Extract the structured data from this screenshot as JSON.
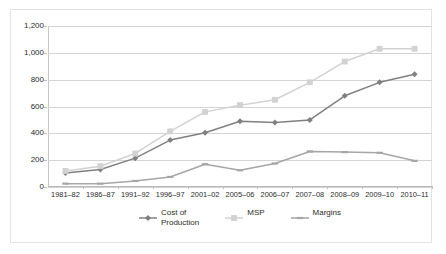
{
  "chart_data": {
    "type": "line",
    "title": "",
    "subtitle": "",
    "xlabel": "",
    "ylabel": "",
    "ylim": [
      0,
      1200
    ],
    "ytick_step": 200,
    "ytick_labels": [
      "0",
      "200",
      "400",
      "600",
      "800",
      "1,000",
      "1,200"
    ],
    "ytick_values": [
      0,
      200,
      400,
      600,
      800,
      1000,
      1200
    ],
    "grid": true,
    "legend_position": "bottom",
    "categories": [
      "1981–82",
      "1986–87",
      "1991–92",
      "1996–97",
      "2001–02",
      "2005–06",
      "2006–07",
      "2007–08",
      "2008–09",
      "2009–10",
      "2010–11"
    ],
    "series": [
      {
        "name": "Cost of Production",
        "legend_label_lines": [
          "Cost of",
          "Production"
        ],
        "color": "#808080",
        "marker": "diamond",
        "values": [
          105,
          130,
          215,
          350,
          405,
          490,
          480,
          500,
          680,
          780,
          840
        ]
      },
      {
        "name": "MSP",
        "legend_label_lines": [
          "MSP"
        ],
        "color": "#d2d2d2",
        "marker": "square",
        "values": [
          120,
          155,
          250,
          415,
          560,
          610,
          650,
          780,
          935,
          1030,
          1030
        ]
      },
      {
        "name": "Margins",
        "legend_label_lines": [
          "Margins"
        ],
        "color": "#a6a6a6",
        "marker": "dash",
        "values": [
          25,
          25,
          45,
          75,
          170,
          125,
          175,
          265,
          260,
          255,
          195
        ]
      }
    ]
  },
  "colors": {
    "background": "#ffffff",
    "frame_border": "#e3e3e3",
    "gridline": "#d4d4d4",
    "axis": "#c0c0c0",
    "text": "#2b2b2b"
  }
}
